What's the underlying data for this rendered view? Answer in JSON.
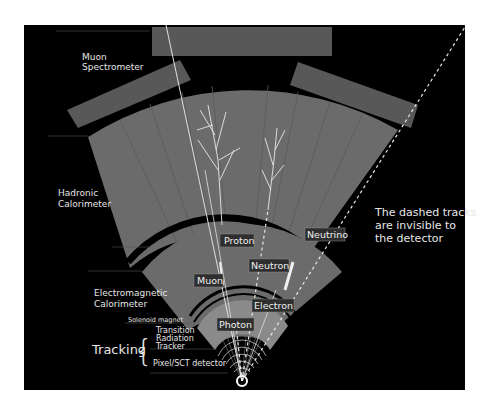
{
  "diagram": {
    "colors": {
      "background": "#000000",
      "page": "#ffffff",
      "detector_grey": "#6b6b6b",
      "muon_chamber": "#5a5a5a",
      "em_inner": "#8a8a8a",
      "label_text": "#e6e6e6",
      "label_box": "#3a3a3a"
    },
    "layers": {
      "muon_spectrometer": [
        "Muon",
        "Spectrometer"
      ],
      "hadronic_calorimeter": [
        "Hadronic",
        "Calorimeter"
      ],
      "em_calorimeter": [
        "Electromagnetic",
        "Calorimeter"
      ],
      "solenoid": "Solenoid magnet",
      "tracking": "Tracking",
      "trt": [
        "Transition",
        "Radiation",
        "Tracker"
      ],
      "pixel": "Pixel/SCT detector"
    },
    "particles": [
      {
        "name": "Proton",
        "dashed": false
      },
      {
        "name": "Neutrino",
        "dashed": true
      },
      {
        "name": "Muon",
        "dashed": false
      },
      {
        "name": "Neutron",
        "dashed": true
      },
      {
        "name": "Electron",
        "dashed": false
      },
      {
        "name": "Photon",
        "dashed": true
      }
    ],
    "note": [
      "The dashed tracks",
      "are invisible to",
      "the detector"
    ]
  }
}
